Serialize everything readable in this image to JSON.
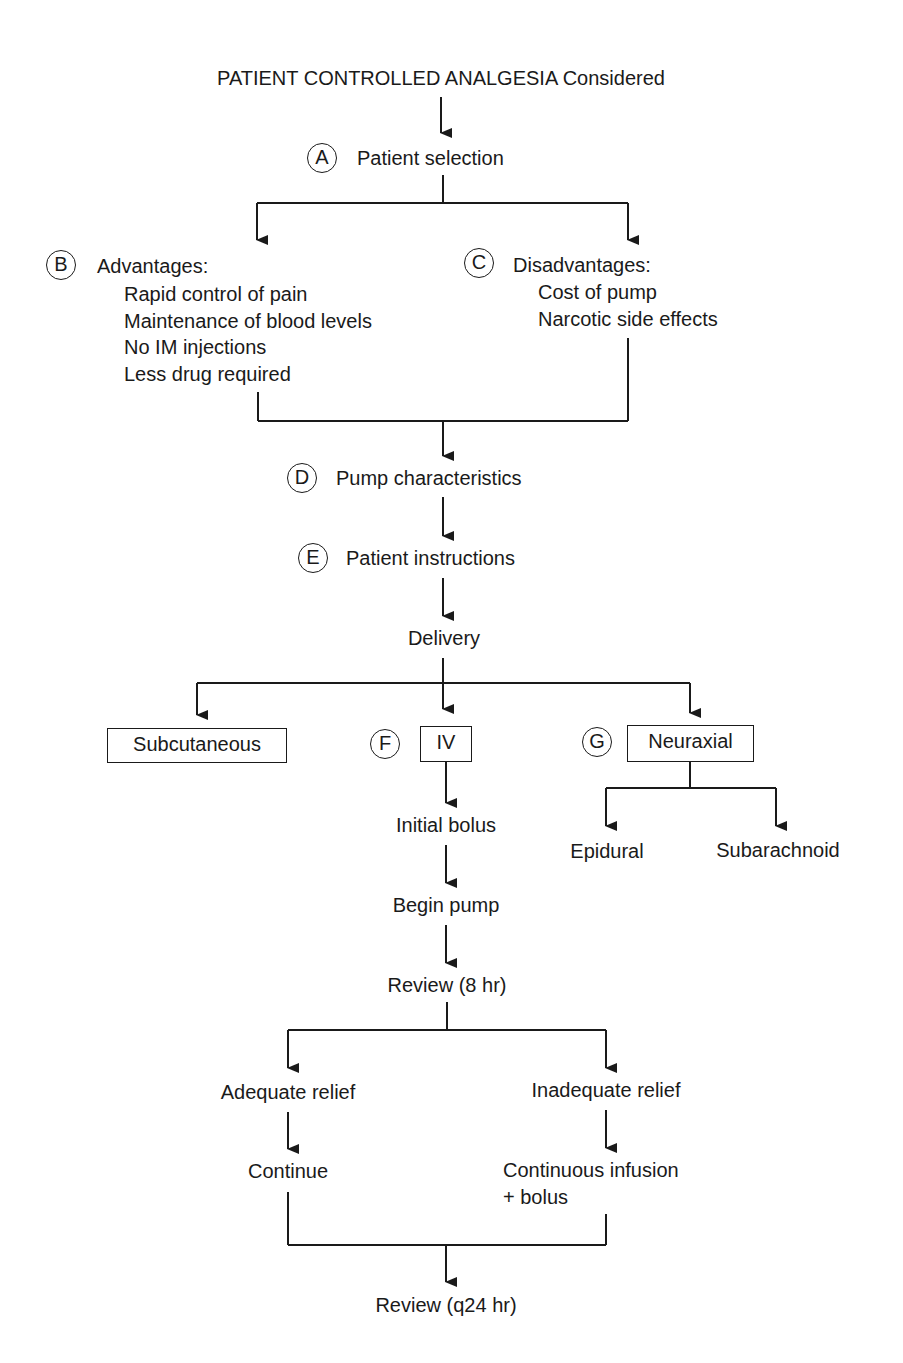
{
  "title": "PATIENT CONTROLLED ANALGESIA Considered",
  "nodes": {
    "A": {
      "marker": "A",
      "label": "Patient selection"
    },
    "B": {
      "marker": "B",
      "label": "Advantages:",
      "items": [
        "Rapid control of pain",
        "Maintenance of blood levels",
        "No IM injections",
        "Less drug required"
      ]
    },
    "C": {
      "marker": "C",
      "label": "Disadvantages:",
      "items": [
        "Cost of pump",
        "Narcotic side effects"
      ]
    },
    "D": {
      "marker": "D",
      "label": "Pump characteristics"
    },
    "E": {
      "marker": "E",
      "label": "Patient instructions"
    },
    "delivery": "Delivery",
    "subcutaneous": "Subcutaneous",
    "F": {
      "marker": "F",
      "label": "IV"
    },
    "G": {
      "marker": "G",
      "label": "Neuraxial"
    },
    "epidural": "Epidural",
    "subarachnoid": "Subarachnoid",
    "initial_bolus": "Initial bolus",
    "begin_pump": "Begin pump",
    "review_8": "Review (8 hr)",
    "adequate": "Adequate relief",
    "inadequate": "Inadequate relief",
    "continue": "Continue",
    "infusion_line1": "Continuous infusion",
    "infusion_line2": "+ bolus",
    "review_24": "Review (q24 hr)"
  }
}
